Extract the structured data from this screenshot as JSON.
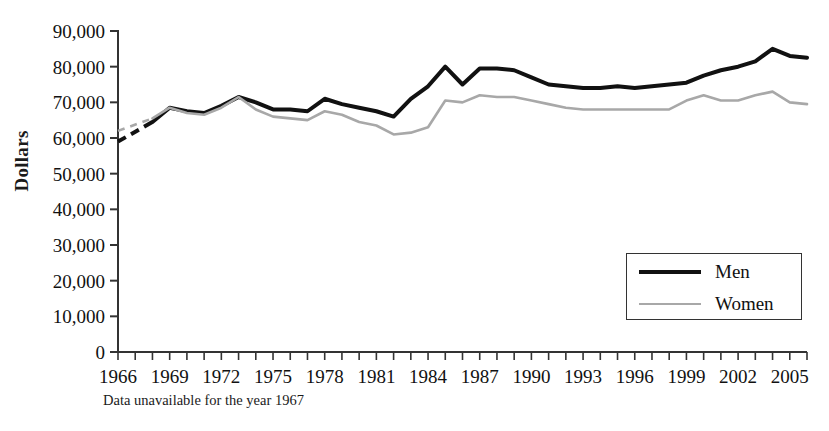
{
  "chart_data": {
    "type": "line",
    "title": "",
    "xlabel": "",
    "ylabel": "Dollars",
    "ylim": [
      0,
      90000
    ],
    "xlim": [
      1966,
      2006
    ],
    "ytick_labels": [
      "90,000",
      "80,000",
      "70,000",
      "60,000",
      "50,000",
      "40,000",
      "30,000",
      "20,000",
      "10,000",
      "0"
    ],
    "ytick_values": [
      90000,
      80000,
      70000,
      60000,
      50000,
      40000,
      30000,
      20000,
      10000,
      0
    ],
    "xtick_labels": [
      "1966",
      "1969",
      "1972",
      "1975",
      "1978",
      "1981",
      "1984",
      "1987",
      "1990",
      "1993",
      "1996",
      "1999",
      "2002",
      "2005"
    ],
    "xtick_values": [
      1966,
      1969,
      1972,
      1975,
      1978,
      1981,
      1984,
      1987,
      1990,
      1993,
      1996,
      1999,
      2002,
      2005
    ],
    "x": [
      1966,
      1968,
      1969,
      1970,
      1971,
      1972,
      1973,
      1974,
      1975,
      1976,
      1977,
      1978,
      1979,
      1980,
      1981,
      1982,
      1983,
      1984,
      1985,
      1986,
      1987,
      1988,
      1989,
      1990,
      1991,
      1992,
      1993,
      1994,
      1995,
      1996,
      1997,
      1998,
      1999,
      2000,
      2001,
      2002,
      2003,
      2004,
      2005,
      2006
    ],
    "grid": false,
    "legend_position": "lower right",
    "annotation": "Data unavailable for the year 1967",
    "series": [
      {
        "name": "Men",
        "color": "#111111",
        "values": [
          59000,
          64500,
          68500,
          67500,
          67000,
          69000,
          71500,
          70000,
          68000,
          68000,
          67500,
          71000,
          69500,
          68500,
          67500,
          66000,
          71000,
          74500,
          80000,
          75000,
          79500,
          79500,
          79000,
          77000,
          75000,
          74500,
          74000,
          74000,
          74500,
          74000,
          74500,
          75000,
          75500,
          77500,
          79000,
          80000,
          81500,
          85000,
          83000,
          82500
        ],
        "dashed_segment": {
          "from": 1966,
          "to": 1968
        }
      },
      {
        "name": "Women",
        "color": "#a8a8a8",
        "values": [
          62000,
          65500,
          68500,
          67000,
          66500,
          68500,
          71500,
          68000,
          66000,
          65500,
          65000,
          67500,
          66500,
          64500,
          63500,
          61000,
          61500,
          63000,
          70500,
          70000,
          72000,
          71500,
          71500,
          70500,
          69500,
          68500,
          68000,
          68000,
          68000,
          68000,
          68000,
          68000,
          70500,
          72000,
          70500,
          70500,
          72000,
          73000,
          70000,
          69500
        ],
        "dashed_segment": {
          "from": 1966,
          "to": 1968
        }
      }
    ]
  },
  "legend": {
    "men_label": "Men",
    "women_label": "Women"
  },
  "axis": {
    "y_title": "Dollars"
  },
  "footnote": {
    "text": "Data unavailable for the year 1967"
  }
}
